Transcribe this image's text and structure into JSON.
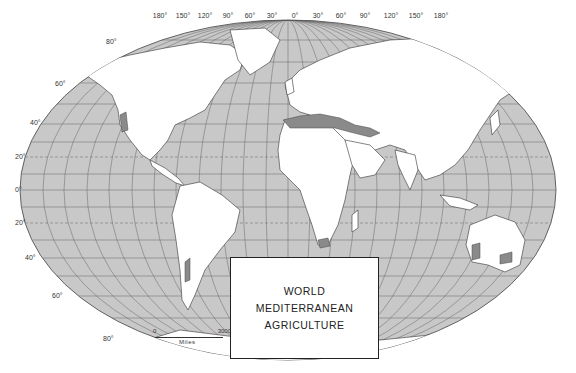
{
  "title": {
    "line1": "WORLD",
    "line2": "MEDITERRANEAN",
    "line3": "AGRICULTURE"
  },
  "longitude_labels": [
    "180°",
    "150°",
    "120°",
    "90°",
    "60°",
    "30°",
    "0°",
    "30°",
    "60°",
    "90°",
    "120°",
    "150°",
    "180°"
  ],
  "latitude_labels": [
    "80°",
    "60°",
    "40°",
    "20°",
    "0°",
    "20°",
    "40°",
    "60°",
    "80°"
  ],
  "scale": {
    "start": "0",
    "end": "3000",
    "unit": "Miles"
  },
  "legend_regions": [
    "California coast",
    "Central Chile",
    "Mediterranean Basin",
    "South Africa (Cape)",
    "Southwest & South Australia"
  ],
  "colors": {
    "ocean": "#c8c8c8",
    "land": "#ffffff",
    "mediterranean": "#8a8a8a",
    "grid": "#555555",
    "border": "#bbbbbb"
  }
}
